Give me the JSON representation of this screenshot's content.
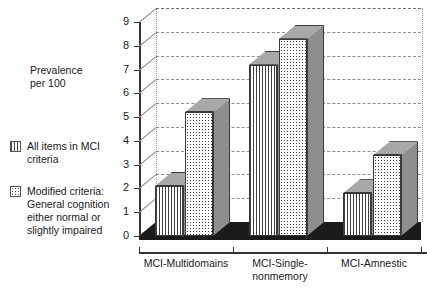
{
  "chart_data": {
    "type": "bar",
    "title": "",
    "subtitle": "",
    "xlabel": "",
    "ylabel": "Prevalence\nper 100",
    "ylim": [
      0,
      9
    ],
    "ytick_labels": [
      "0",
      "1",
      "2",
      "3",
      "4",
      "5",
      "6",
      "7",
      "8",
      "9"
    ],
    "yticks": [
      0,
      1,
      2,
      3,
      4,
      5,
      6,
      7,
      8,
      9
    ],
    "grid": true,
    "grid_style": "dashed horizontal",
    "legend_position": "left",
    "categories": [
      "MCI-Multidomains",
      "MCI-Single-\nnonmemory",
      "MCI-Amnestic"
    ],
    "series": [
      {
        "name": "All items in MCI\ncriteria",
        "pattern": "vertical-stripes",
        "values": [
          2.1,
          7.2,
          1.8
        ]
      },
      {
        "name": "Modified criteria:\nGeneral cognition\neither normal or\nslightly impaired",
        "pattern": "dots",
        "values": [
          5.2,
          8.3,
          3.4
        ]
      }
    ],
    "colors": {
      "bar_outline": "#3a3a3a",
      "bar_side": "#8e8e8e",
      "bar_top": "#a8a8a8",
      "gridline": "#8d8d8d",
      "axis": "#333333",
      "floor": "#1b1b1b",
      "background": "#ffffff",
      "text": "#1a1a1a"
    }
  }
}
